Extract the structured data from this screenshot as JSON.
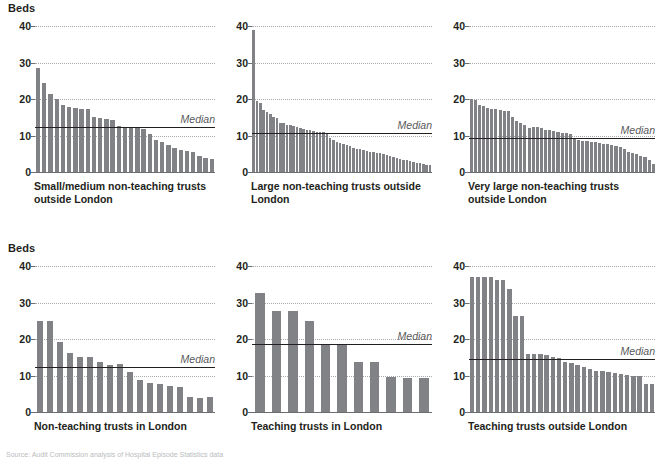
{
  "figure": {
    "y_axis_title": "Beds",
    "median_label": "Median",
    "y_ticks": [
      0,
      10,
      20,
      30,
      40
    ],
    "y_min": 0,
    "y_max": 40,
    "bar_color": "#808285",
    "median_line_color": "#231f20",
    "gridline_color": "#a7a9ac",
    "footnote": "Source: Audit Commission analysis of Hospital Episode Statistics data"
  },
  "chart_data": [
    {
      "type": "bar",
      "id": "small-medium-non-teaching-outside-london",
      "title": "Small/medium non-teaching trusts\noutside London",
      "ylabel": "Beds",
      "ylim": [
        0,
        40
      ],
      "yticks": [
        0,
        10,
        20,
        30,
        40
      ],
      "grid": true,
      "median": 12.2,
      "median_label": "Median",
      "values": [
        28.4,
        24.5,
        21.3,
        20.0,
        18.4,
        17.9,
        17.6,
        17.3,
        17.3,
        15.1,
        14.7,
        14.4,
        14.3,
        12.7,
        12.3,
        12.2,
        12.0,
        11.9,
        10.4,
        8.8,
        8.3,
        7.3,
        6.5,
        6.1,
        5.7,
        5.4,
        4.3,
        3.9,
        3.5
      ]
    },
    {
      "type": "bar",
      "id": "large-non-teaching-outside-london",
      "title": "Large non-teaching trusts outside\nLondon",
      "ylabel": "Beds",
      "ylim": [
        0,
        40
      ],
      "yticks": [
        0,
        10,
        20,
        30,
        40
      ],
      "grid": true,
      "median": 10.7,
      "median_label": "Median",
      "values": [
        39.0,
        19.5,
        18.9,
        17.1,
        16.5,
        16.0,
        15.2,
        14.7,
        13.5,
        13.3,
        13.0,
        12.8,
        12.6,
        12.3,
        12.1,
        11.9,
        11.6,
        11.4,
        11.2,
        11.1,
        11.0,
        10.9,
        10.8,
        9.4,
        8.8,
        8.3,
        7.9,
        7.6,
        7.3,
        7.0,
        6.7,
        6.4,
        6.2,
        6.0,
        5.8,
        5.6,
        5.4,
        5.3,
        5.1,
        4.9,
        4.6,
        4.3,
        4.0,
        3.8,
        3.6,
        3.4,
        3.2,
        3.0,
        2.8,
        2.6,
        2.4,
        2.2,
        2.0,
        1.9
      ]
    },
    {
      "type": "bar",
      "id": "very-large-non-teaching-outside-london",
      "title": "Very large non-teaching trusts\noutside London",
      "ylabel": "Beds",
      "ylim": [
        0,
        40
      ],
      "yticks": [
        0,
        10,
        20,
        30,
        40
      ],
      "grid": true,
      "median": 9.4,
      "median_label": "Median",
      "values": [
        20.1,
        19.6,
        18.3,
        18.1,
        17.6,
        17.4,
        17.2,
        17.0,
        16.8,
        16.6,
        15.1,
        13.9,
        13.3,
        12.9,
        12.0,
        12.2,
        12.3,
        12.1,
        11.6,
        11.4,
        11.2,
        11.0,
        10.8,
        10.6,
        10.5,
        9.2,
        8.8,
        8.6,
        8.5,
        8.3,
        8.2,
        8.0,
        7.8,
        7.6,
        7.4,
        7.2,
        6.8,
        6.3,
        5.6,
        5.2,
        4.8,
        4.4,
        4.0,
        3.3,
        2.3
      ]
    },
    {
      "type": "bar",
      "id": "non-teaching-trusts-in-london",
      "title": "Non-teaching trusts in London",
      "ylabel": "Beds",
      "ylim": [
        0,
        40
      ],
      "yticks": [
        0,
        10,
        20,
        30,
        40
      ],
      "grid": true,
      "median": 12.4,
      "median_label": "Median",
      "values": [
        24.9,
        24.9,
        19.2,
        16.2,
        15.0,
        15.0,
        13.7,
        13.0,
        13.1,
        10.9,
        8.7,
        7.9,
        7.6,
        7.1,
        6.9,
        4.1,
        3.9,
        4.0
      ]
    },
    {
      "type": "bar",
      "id": "teaching-trusts-in-london",
      "title": "Teaching trusts in London",
      "ylabel": "Beds",
      "ylim": [
        0,
        40
      ],
      "yticks": [
        0,
        10,
        20,
        30,
        40
      ],
      "grid": true,
      "median": 18.5,
      "median_label": "Median",
      "values": [
        32.7,
        27.6,
        27.6,
        24.8,
        18.3,
        18.3,
        13.6,
        13.6,
        9.7,
        9.4,
        9.4
      ]
    },
    {
      "type": "bar",
      "id": "teaching-trusts-outside-london",
      "title": "Teaching trusts outside London",
      "ylabel": "Beds",
      "ylim": [
        0,
        40
      ],
      "yticks": [
        0,
        10,
        20,
        30,
        40
      ],
      "grid": true,
      "median": 14.6,
      "median_label": "Median",
      "values": [
        37.0,
        37.0,
        37.0,
        36.9,
        36.2,
        36.2,
        33.6,
        26.2,
        26.3,
        15.9,
        15.9,
        15.8,
        15.7,
        15.0,
        14.9,
        13.6,
        13.5,
        12.9,
        12.4,
        11.9,
        11.3,
        11.2,
        10.9,
        10.7,
        10.5,
        10.2,
        10.0,
        10.0,
        7.8,
        7.6
      ]
    }
  ]
}
